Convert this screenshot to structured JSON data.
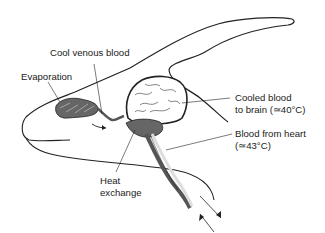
{
  "diagram": {
    "type": "anatomical-illustration",
    "labels": {
      "cool_venous_blood": "Cool venous blood",
      "evaporation": "Evaporation",
      "cooled_blood_line1": "Cooled blood",
      "cooled_blood_line2": "to brain (≃40°C)",
      "blood_from_heart_line1": "Blood from heart",
      "blood_from_heart_line2": "(≃43°C)",
      "heat_line1": "Heat",
      "heat_line2": "exchange"
    },
    "colors": {
      "outline": "#222222",
      "vessel_dark": "#555555",
      "vessel_light": "#dddddd",
      "brain_fill": "#ffffff",
      "rete_fill": "#666666"
    }
  }
}
